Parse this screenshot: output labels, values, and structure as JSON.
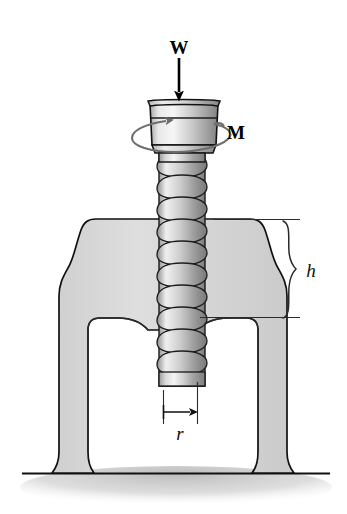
{
  "figure": {
    "background_color": "#ffffff"
  },
  "labels": {
    "load": {
      "text": "W",
      "meaning": "applied axial load",
      "style": "bold-serif",
      "x": 179,
      "y": 48
    },
    "moment": {
      "text": "M",
      "meaning": "applied torque about screw axis",
      "style": "bold-serif",
      "x": 236,
      "y": 130
    },
    "height": {
      "text": "h",
      "meaning": "clamp throat height dimension",
      "style": "italic-serif",
      "x": 311,
      "y": 277
    },
    "radius": {
      "text": "r",
      "meaning": "screw mean thread radius",
      "style": "italic-serif",
      "x": 188,
      "y": 437
    }
  },
  "annotations": {
    "load_arrow": {
      "name": "downward-force-arrow",
      "from_y": 58,
      "to_y": 101,
      "x": 179
    },
    "moment_arc": {
      "name": "rotation-ellipse-arrow",
      "center_x": 184,
      "center_y": 132,
      "rx": 50,
      "ry": 12
    },
    "height_brace": {
      "name": "curly-brace",
      "top_y": 221,
      "bottom_y": 318,
      "x": 286
    },
    "height_leader_top_y": 219,
    "height_leader_bottom_y": 317,
    "radius_dim": {
      "name": "radius-dimension-arrow",
      "from_x": 163,
      "to_x": 196,
      "y": 412
    }
  },
  "colors": {
    "outline": "#111111",
    "clamp_fill": "#d6d6d6",
    "metal_light": "#f2f2f2",
    "metal_mid": "#c9c9c9",
    "metal_dark": "#8a8a8a",
    "ground_line": "#111111",
    "ground_shadow": "#cfcfcf"
  },
  "geometry": {
    "screw": {
      "head_top_y": 100,
      "head_left_x": 148,
      "head_right_x": 220,
      "shaft_left_x": 159,
      "shaft_right_x": 205,
      "shaft_bottom_y": 386,
      "thread_count": 11
    },
    "clamp": {
      "left_outer_x": 72,
      "right_outer_x": 285,
      "top_y": 219,
      "ground_y": 473
    },
    "ground": {
      "line_y": 473,
      "left_x": 22,
      "right_x": 330
    }
  }
}
